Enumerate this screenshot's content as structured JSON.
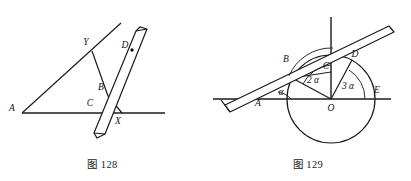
{
  "page": {
    "background_color": "#ffffff",
    "ink_color": "#1b1b1b",
    "width": 411,
    "height": 181
  },
  "figures": [
    {
      "id": "figure-128",
      "caption_prefix": "图",
      "caption_number": "128",
      "caption_full": "图 128",
      "description": "A straightedge (ruler) laid across an angle; lines through A, with points Y, B, C, X, D marked.",
      "point_labels": [
        {
          "name": "A",
          "text": "A",
          "x": 12,
          "y": 111
        },
        {
          "name": "Y",
          "text": "Y",
          "x": 86,
          "y": 45
        },
        {
          "name": "B",
          "text": "B",
          "x": 101,
          "y": 90
        },
        {
          "name": "C",
          "text": "C",
          "x": 90,
          "y": 106
        },
        {
          "name": "X",
          "text": "X",
          "x": 118,
          "y": 122
        },
        {
          "name": "D",
          "text": "D",
          "x": 125,
          "y": 48
        }
      ],
      "has_marker_dot": true,
      "marker_dot": {
        "x": 132,
        "y": 50
      }
    },
    {
      "id": "figure-129",
      "caption_prefix": "图",
      "caption_number": "129",
      "caption_full": "图 129",
      "description": "A circle centered at O with horizontal diameter line through A, O and E; a straightedge crosses tangentially through B, C and D; angles alpha, 2 alpha and 3 alpha are marked at O.",
      "point_labels": [
        {
          "name": "A",
          "text": "A",
          "x": 258,
          "y": 103
        },
        {
          "name": "B",
          "text": "B",
          "x": 295,
          "y": 58
        },
        {
          "name": "C",
          "text": "C",
          "x": 331,
          "y": 68
        },
        {
          "name": "D",
          "text": "D",
          "x": 352,
          "y": 58
        },
        {
          "name": "E",
          "text": "E",
          "x": 378,
          "y": 88
        },
        {
          "name": "O",
          "text": "O",
          "x": 331,
          "y": 104
        }
      ],
      "angle_labels": [
        {
          "name": "alpha-angle",
          "text": "α",
          "x": 281,
          "y": 92
        },
        {
          "name": "two-alpha-angle",
          "text": "2 α",
          "x": 311,
          "y": 79
        },
        {
          "name": "three-alpha-angle",
          "text": "3 α",
          "x": 345,
          "y": 84
        }
      ]
    }
  ]
}
